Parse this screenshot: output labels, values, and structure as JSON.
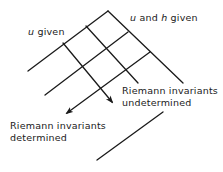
{
  "figure": {
    "type": "characteristics-diagram",
    "stroke_color": "#1a1a1a",
    "background": "#ffffff"
  },
  "labels": {
    "u_given": {
      "var": "u",
      "text": " given"
    },
    "u_and_h_given": {
      "var1": "u",
      "mid": " and ",
      "var2": "h",
      "text": " given"
    },
    "riemann_determined": {
      "line1": "Riemann invariants",
      "line2": "determined"
    },
    "riemann_undetermined": {
      "line1": "Riemann invariants",
      "line2": "undetermined"
    }
  },
  "geometry": {
    "apex": [
      108,
      11
    ],
    "left_boundary_end": [
      28,
      71
    ],
    "right_boundary_end": [
      183,
      83
    ],
    "down_right_characteristics": [
      {
        "from": [
          86,
          26
        ],
        "to": [
          138,
          83
        ],
        "arrow": false
      },
      {
        "from": [
          63,
          43
        ],
        "to": [
          113,
          103
        ],
        "arrow": true
      }
    ],
    "down_left_characteristics": [
      {
        "from": [
          128,
          32
        ],
        "to": [
          45,
          95
        ],
        "arrow": false
      },
      {
        "from": [
          150,
          52
        ],
        "to": [
          66,
          114
        ],
        "arrow": true
      }
    ],
    "lower_line": {
      "from": [
        163,
        112
      ],
      "to": [
        97,
        160
      ]
    }
  }
}
